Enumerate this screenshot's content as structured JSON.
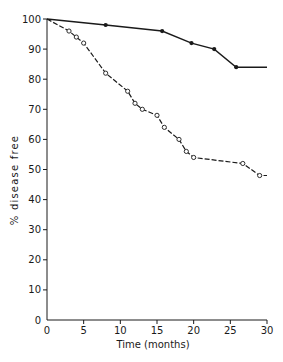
{
  "chart_data": {
    "type": "line",
    "title": "",
    "xlabel": "Time (months)",
    "ylabel": "% disease free",
    "xlim": [
      0,
      30
    ],
    "ylim": [
      0,
      100
    ],
    "xticks": [
      0,
      5,
      10,
      15,
      20,
      25,
      30
    ],
    "yticks": [
      0,
      10,
      20,
      30,
      40,
      50,
      60,
      70,
      80,
      90,
      100
    ],
    "grid": false,
    "legend": null,
    "series": [
      {
        "name": "Filled circles (solid line)",
        "marker": "filled-circle",
        "line_style": "solid",
        "color": "#1a1a1a",
        "x": [
          0,
          8,
          15.7,
          19.7,
          22.8,
          25.8,
          30
        ],
        "y": [
          100,
          98,
          96,
          92,
          90,
          84,
          84
        ],
        "marked": [
          false,
          true,
          true,
          true,
          true,
          true,
          false
        ]
      },
      {
        "name": "Open circles (dashed line)",
        "marker": "open-circle",
        "line_style": "dashed",
        "color": "#1a1a1a",
        "x": [
          0,
          3,
          4,
          5,
          8,
          11,
          12,
          13,
          15,
          16,
          18,
          19,
          20,
          26.7,
          29,
          30
        ],
        "y": [
          100,
          96,
          94,
          92,
          82,
          76,
          72,
          70,
          68,
          64,
          60,
          56,
          54,
          52,
          48,
          48
        ],
        "marked": [
          false,
          true,
          true,
          true,
          true,
          true,
          true,
          true,
          true,
          true,
          true,
          true,
          true,
          true,
          true,
          false
        ]
      }
    ]
  },
  "axes": {
    "x_label": "Time (months)",
    "y_label": "% disease free"
  }
}
